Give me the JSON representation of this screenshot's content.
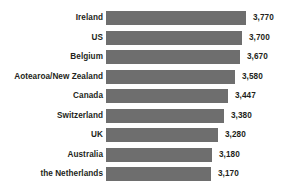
{
  "chart_data": {
    "type": "bar",
    "orientation": "horizontal",
    "title": "",
    "subtitle": "",
    "xlabel": "",
    "ylabel": "",
    "grid": false,
    "legend": false,
    "legend_position": "none",
    "axis_visible": false,
    "tick_labels": [],
    "bar_color": "#6e6e6e",
    "label_color": "#231f20",
    "background_color": "#ffffff",
    "value_axis_min": 3000,
    "value_axis_max": 3850,
    "categories": [
      "Ireland",
      "US",
      "Belgium",
      "Aotearoa/New Zealand",
      "Canada",
      "Switzerland",
      "UK",
      "Australia",
      "the Netherlands"
    ],
    "values": [
      3770,
      3700,
      3670,
      3580,
      3447,
      3380,
      3280,
      3180,
      3170
    ],
    "value_labels": [
      "3,770",
      "3,700",
      "3,670",
      "3,580",
      "3,447",
      "3,380",
      "3,280",
      "3,180",
      "3,170"
    ],
    "bar_pixel_widths": [
      140,
      136,
      134,
      129,
      122,
      118,
      112,
      106,
      105
    ]
  }
}
